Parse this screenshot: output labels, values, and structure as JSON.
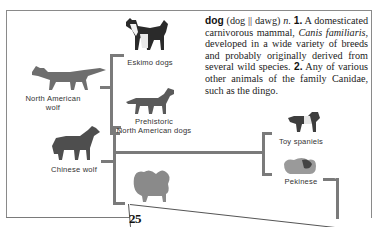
{
  "definition": {
    "headword": "dog",
    "pronunciation": "(dog || dawg)",
    "part_of_speech": "n.",
    "sense1_num": "1.",
    "sense1_text_a": " A domesticated carnivorous mammal, ",
    "sense1_species": "Canis familiaris",
    "sense1_text_b": ", developed in a wide variety of breeds and probably originally derived from several wild species. ",
    "sense2_num": "2.",
    "sense2_text": " Any of various other animals of the family Canidae, such as the dingo."
  },
  "labels": {
    "eskimo_dogs": "Eskimo dogs",
    "north_american_wolf_line1": "North American",
    "north_american_wolf_line2": "wolf",
    "prehistoric_line1": "Prehistoric",
    "prehistoric_line2": "North American dogs",
    "chinese_wolf": "Chinese wolf",
    "toy_spaniels": "Toy spaniels",
    "pekinese": "Pekinese"
  },
  "page_number": "25",
  "colors": {
    "bracket": "#7a7a7a",
    "text": "#222222",
    "page_border": "#8a8a8a"
  }
}
